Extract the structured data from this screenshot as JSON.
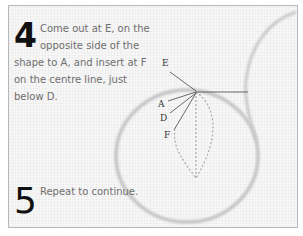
{
  "steps": [
    {
      "number": "4",
      "text": "Come out at E, on the opposite side of the shape to A, and insert at F on the centre line, just below D."
    },
    {
      "number": "5",
      "text": "Repeat to continue."
    }
  ],
  "diagram": {
    "labels": {
      "e": "E",
      "a": "A",
      "d": "D",
      "f": "F"
    }
  }
}
